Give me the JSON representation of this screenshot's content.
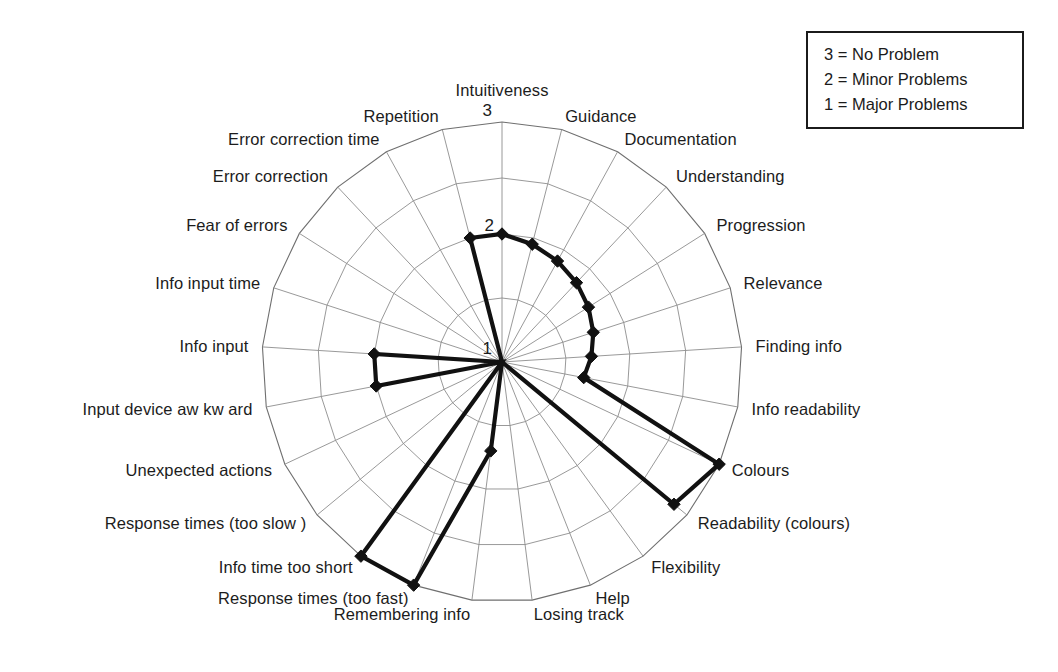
{
  "legend": {
    "name": "scale-legend",
    "rows": [
      "3 = No Problem",
      "2 = Minor Problems",
      "1 = Major Problems"
    ]
  },
  "ticks": {
    "inner": "1",
    "middle": "2",
    "outer": "3"
  },
  "chart_data": {
    "type": "radar",
    "title": "",
    "subtitle": "",
    "xlabel": "",
    "ylabel": "",
    "rlim": [
      1,
      3
    ],
    "rticks": [
      1,
      2,
      3
    ],
    "rtick_labels": [
      "1",
      "2",
      "3"
    ],
    "grid": true,
    "legend_position": "top-right",
    "legend_entries": [
      "3 = No Problem",
      "2 = Minor Problems",
      "1 = Major Problems"
    ],
    "start_angle_deg": 90,
    "direction": "clockwise",
    "categories": [
      "Intuitiveness",
      "Guidance",
      "Documentation",
      "Understanding",
      "Progression",
      "Relevance",
      "Finding info",
      "Info readability",
      "Colours",
      "Readability (colours)",
      "Flexibility",
      "Help",
      "Losing track",
      "Remembering info",
      "Response times (too fast)",
      "Info time too short",
      "Response times (too slow )",
      "Unexpected actions",
      "Input device aw kw ard",
      "Info input",
      "Info input time",
      "Fear of errors",
      "Error  correction",
      "Error  correction time",
      "Repetition"
    ],
    "series": [
      {
        "name": "Usability problem rating",
        "values": [
          2.0,
          1.95,
          1.9,
          1.85,
          1.8,
          1.75,
          1.7,
          1.65,
          3.0,
          2.85,
          1.0,
          1.0,
          1.0,
          1.7,
          3.0,
          3.0,
          1.0,
          1.0,
          2.0,
          2.0,
          1.0,
          1.0,
          1.0,
          1.0,
          2.0
        ]
      }
    ]
  },
  "geometry": {
    "cx": 502,
    "cy": 362,
    "r_outer": 240,
    "r_mid": 128
  }
}
